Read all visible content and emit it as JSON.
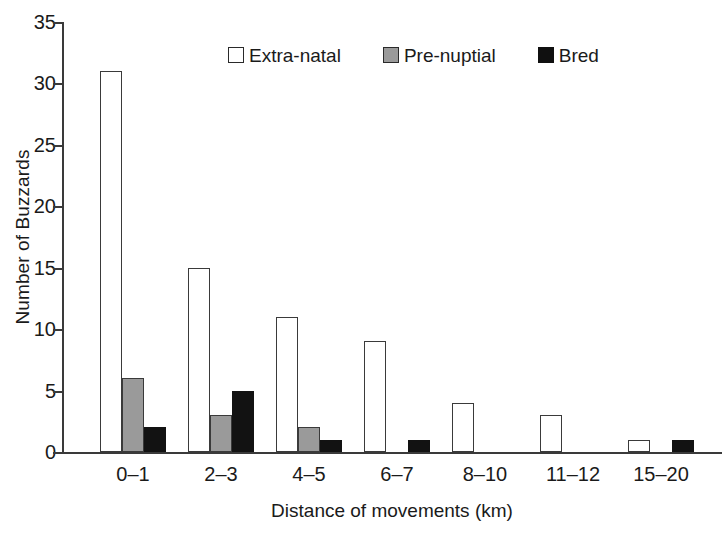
{
  "chart_data": {
    "type": "bar",
    "title": "",
    "xlabel": "Distance of movements (km)",
    "ylabel": "Number of Buzzards",
    "categories": [
      "0–1",
      "2–3",
      "4–5",
      "6–7",
      "8–10",
      "11–12",
      "15–20"
    ],
    "series": [
      {
        "name": "Extra-natal",
        "color": "#ffffff",
        "values": [
          31,
          15,
          11,
          9,
          4,
          3,
          1
        ]
      },
      {
        "name": "Pre-nuptial",
        "color": "#9a9a9a",
        "values": [
          6,
          3,
          2,
          0,
          0,
          0,
          0
        ]
      },
      {
        "name": "Bred",
        "color": "#101010",
        "values": [
          2,
          5,
          1,
          1,
          0,
          0,
          1
        ]
      }
    ],
    "ylim": [
      0,
      35
    ],
    "y_ticks": [
      0,
      5,
      10,
      15,
      20,
      25,
      30,
      35
    ],
    "y_tick_labels": [
      "0",
      "5",
      "10",
      "15",
      "20",
      "25",
      "30",
      "35"
    ],
    "grid": false,
    "legend_position": "top-center",
    "bar_style": "grouped-adjacent"
  },
  "legend": {
    "items": [
      {
        "label": "Extra-natal",
        "swatch": "open-square-swatch"
      },
      {
        "label": "Pre-nuptial",
        "swatch": "gray-square-swatch"
      },
      {
        "label": "Bred",
        "swatch": "filled-square-swatch"
      }
    ]
  }
}
